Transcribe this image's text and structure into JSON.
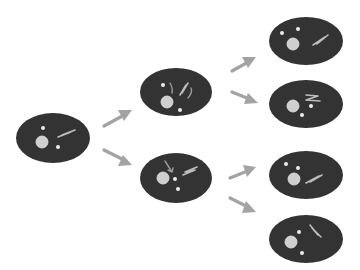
{
  "diagram": {
    "title": "Cell lineage: one cell dividing into two, then four",
    "colors": {
      "background": "#ffffff",
      "cell": "#333333",
      "nucleus": "#cfcfcf",
      "marker": "#ececec",
      "arrow": "#a3a3a3"
    },
    "generations": [
      {
        "label": "generation-1",
        "cells": [
          {
            "id": "cell-g1",
            "organelles": [
              "nucleus",
              "star",
              "star",
              "squiggle"
            ]
          }
        ]
      },
      {
        "label": "generation-2",
        "cells": [
          {
            "id": "cell-g2-top",
            "organelles": [
              "nucleus",
              "star",
              "star",
              "squiggle-pair",
              "curved-arrows"
            ]
          },
          {
            "id": "cell-g2-bottom",
            "organelles": [
              "nucleus",
              "star",
              "star",
              "squiggle",
              "pointer-arrow"
            ]
          }
        ]
      },
      {
        "label": "generation-3",
        "cells": [
          {
            "id": "cell-g3-1",
            "organelles": [
              "nucleus",
              "star",
              "star",
              "squiggle"
            ]
          },
          {
            "id": "cell-g3-2",
            "organelles": [
              "nucleus",
              "star",
              "star",
              "squiggle"
            ]
          },
          {
            "id": "cell-g3-3",
            "organelles": [
              "nucleus",
              "star",
              "star",
              "squiggle"
            ]
          },
          {
            "id": "cell-g3-4",
            "organelles": [
              "nucleus",
              "star",
              "squiggle",
              "star"
            ]
          }
        ]
      }
    ],
    "arrows": [
      {
        "from": "cell-g1",
        "to": "cell-g2-top"
      },
      {
        "from": "cell-g1",
        "to": "cell-g2-bottom"
      },
      {
        "from": "cell-g2-top",
        "to": "cell-g3-1"
      },
      {
        "from": "cell-g2-top",
        "to": "cell-g3-2"
      },
      {
        "from": "cell-g2-bottom",
        "to": "cell-g3-3"
      },
      {
        "from": "cell-g2-bottom",
        "to": "cell-g3-4"
      }
    ]
  }
}
